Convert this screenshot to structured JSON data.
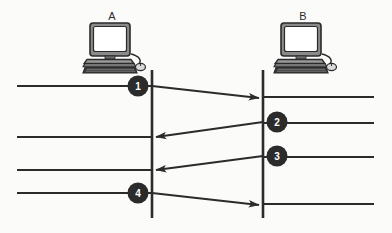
{
  "diagram": {
    "type": "sequence-diagram",
    "title": "",
    "background_color": "#fbfbfa",
    "line_color": "#2b2b2b",
    "badge_color": "#2b2b2b",
    "badge_text_color": "#ffffff",
    "hosts": [
      {
        "id": "A",
        "label": "A",
        "icon": "desktop-computer-icon",
        "icon_x": 112,
        "icon_y": 24,
        "label_x": 112,
        "label_y": 20,
        "lifeline_x": 152,
        "lifeline_top": 70,
        "lifeline_bottom": 218
      },
      {
        "id": "B",
        "label": "B",
        "icon": "desktop-computer-icon",
        "icon_x": 303,
        "icon_y": 24,
        "label_x": 303,
        "label_y": 20,
        "lifeline_x": 263,
        "lifeline_top": 70,
        "lifeline_bottom": 218
      }
    ],
    "timeline_segments": [
      {
        "name": "a-segment-1",
        "side": "left",
        "x1": 17,
        "x2": 152,
        "y": 86
      },
      {
        "name": "a-segment-2",
        "side": "left",
        "x1": 17,
        "x2": 152,
        "y": 137
      },
      {
        "name": "a-segment-3",
        "side": "left",
        "x1": 17,
        "x2": 152,
        "y": 170
      },
      {
        "name": "a-segment-4",
        "side": "left",
        "x1": 17,
        "x2": 152,
        "y": 193
      },
      {
        "name": "b-segment-1",
        "side": "right",
        "x1": 263,
        "x2": 374,
        "y": 97
      },
      {
        "name": "b-segment-2",
        "side": "right",
        "x1": 263,
        "x2": 374,
        "y": 123
      },
      {
        "name": "b-segment-3",
        "side": "right",
        "x1": 263,
        "x2": 374,
        "y": 157
      },
      {
        "name": "b-segment-4",
        "side": "right",
        "x1": 263,
        "x2": 374,
        "y": 204
      }
    ],
    "messages": [
      {
        "step": "1",
        "direction": "a-to-b",
        "from_host": "A",
        "to_host": "B",
        "x1": 152,
        "y1": 86,
        "x2": 261,
        "y2": 98,
        "badge_x": 138,
        "badge_y": 86,
        "badge_r": 10
      },
      {
        "step": "2",
        "direction": "b-to-a",
        "from_host": "B",
        "to_host": "A",
        "x1": 263,
        "y1": 122,
        "x2": 154,
        "y2": 137,
        "badge_x": 277,
        "badge_y": 122,
        "badge_r": 10
      },
      {
        "step": "3",
        "direction": "b-to-a",
        "from_host": "B",
        "to_host": "A",
        "x1": 263,
        "y1": 156,
        "x2": 154,
        "y2": 170,
        "badge_x": 277,
        "badge_y": 156,
        "badge_r": 10
      },
      {
        "step": "4",
        "direction": "a-to-b",
        "from_host": "A",
        "to_host": "B",
        "x1": 152,
        "y1": 193,
        "x2": 261,
        "y2": 205,
        "badge_x": 138,
        "badge_y": 193,
        "badge_r": 10
      }
    ]
  }
}
